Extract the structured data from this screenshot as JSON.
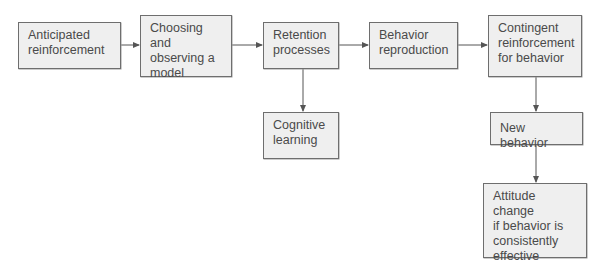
{
  "diagram": {
    "nodes": [
      {
        "id": "anticipated",
        "label": "Anticipated\nreinforcement"
      },
      {
        "id": "choosing",
        "label": "Choosing and\nobserving a\nmodel"
      },
      {
        "id": "retention",
        "label": "Retention\nprocesses"
      },
      {
        "id": "reproduction",
        "label": "Behavior\nreproduction"
      },
      {
        "id": "contingent",
        "label": "Contingent\nreinforcement\nfor behavior"
      },
      {
        "id": "cognitive",
        "label": "Cognitive\nlearning"
      },
      {
        "id": "new_behavior",
        "label": "New behavior"
      },
      {
        "id": "attitude",
        "label": "Attitude change\nif behavior is\nconsistently\neffective"
      }
    ],
    "edges": [
      {
        "from": "anticipated",
        "to": "choosing"
      },
      {
        "from": "choosing",
        "to": "retention"
      },
      {
        "from": "retention",
        "to": "reproduction"
      },
      {
        "from": "reproduction",
        "to": "contingent"
      },
      {
        "from": "retention",
        "to": "cognitive"
      },
      {
        "from": "contingent",
        "to": "new_behavior"
      },
      {
        "from": "new_behavior",
        "to": "attitude"
      }
    ],
    "colors": {
      "box_fill": "#efefef",
      "box_border": "#6e6e6e",
      "text": "#4a4a4a",
      "arrow": "#555555"
    }
  }
}
